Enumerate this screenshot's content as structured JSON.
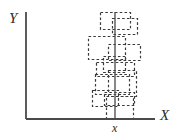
{
  "figure": {
    "type": "diagram",
    "background_color": "#ffffff",
    "axis_color": "#4a4a4a",
    "box_color": "#3a3a3a",
    "vline_color": "#555555"
  },
  "axes": {
    "y_label": "Y",
    "x_label": "X",
    "tick_label": "x",
    "origin": {
      "x": 26,
      "y": 119
    },
    "x_axis_end": {
      "x": 155,
      "y": 119
    },
    "y_axis_top": {
      "x": 26,
      "y": 12
    }
  },
  "vertical_line": {
    "name": "x-marker-line",
    "x": 115,
    "y_top": 12,
    "y_bottom": 119
  },
  "chart_data": {
    "type": "diagram",
    "title": "",
    "xlabel": "X",
    "ylabel": "Y",
    "tick_labels": [
      "x"
    ],
    "boxes": [
      {
        "id": 1,
        "x": 100,
        "y": 12,
        "w": 30,
        "h": 17
      },
      {
        "id": 2,
        "x": 112,
        "y": 18,
        "w": 25,
        "h": 16
      },
      {
        "id": 3,
        "x": 88,
        "y": 36,
        "w": 37,
        "h": 23
      },
      {
        "id": 4,
        "x": 108,
        "y": 44,
        "w": 32,
        "h": 16
      },
      {
        "id": 5,
        "x": 103,
        "y": 56,
        "w": 22,
        "h": 16
      },
      {
        "id": 6,
        "x": 96,
        "y": 62,
        "w": 38,
        "h": 14
      },
      {
        "id": 7,
        "x": 95,
        "y": 74,
        "w": 34,
        "h": 20
      },
      {
        "id": 8,
        "x": 108,
        "y": 70,
        "w": 28,
        "h": 26
      },
      {
        "id": 9,
        "x": 92,
        "y": 90,
        "w": 26,
        "h": 16
      },
      {
        "id": 10,
        "x": 104,
        "y": 92,
        "w": 30,
        "h": 13
      },
      {
        "id": 11,
        "x": 106,
        "y": 96,
        "w": 27,
        "h": 23
      }
    ]
  }
}
